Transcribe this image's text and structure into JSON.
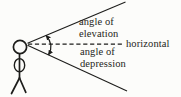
{
  "diagram": {
    "labels": {
      "elevation": "angle of\nelevation",
      "horizontal": "horizontal",
      "depression": "angle of\ndepression"
    },
    "colors": {
      "ink": "#1d1d1b",
      "text": "#252521",
      "background": "#fcfcfa"
    }
  }
}
